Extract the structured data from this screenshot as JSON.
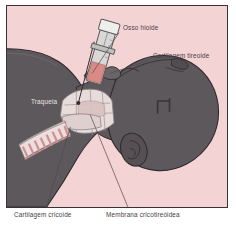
{
  "figure": {
    "kind": "medical-illustration",
    "language": "pt-BR",
    "background_color": "#f4d3d5",
    "frame_color": "#3a3236",
    "body_color": "#5d585c",
    "cartilage_color": "#e8dcdb",
    "trachea_ring_color": "#d8a3a5",
    "syringe_body_color": "#d8d8d6",
    "syringe_fluid_color": "#d98a86"
  },
  "labels": {
    "hyoid_bone": "Osso hioide",
    "thyroid_cartilage": "Cartilagem tireoide",
    "trachea": "Traqueia",
    "cricoid_cartilage": "Cartilagem cricoide",
    "cricothyroid_membrane": "Membrana cricotireóidea"
  },
  "label_positions": {
    "hyoid_bone": {
      "x": 116,
      "y": 22
    },
    "thyroid_cartilage": {
      "x": 146,
      "y": 50
    },
    "trachea": {
      "x": 23,
      "y": 95
    },
    "cricoid_cartilage": {
      "x": 14,
      "y": 16
    },
    "cricothyroid_membrane": {
      "x": 104,
      "y": 16
    }
  },
  "leader_lines": [
    {
      "name": "hyoid-leader",
      "x1": 113,
      "y1": 27,
      "x2": 83,
      "y2": 69
    },
    {
      "name": "thyroid-leader",
      "x1": 143,
      "y1": 55,
      "x2": 96,
      "y2": 70
    },
    {
      "name": "cricoid-leader",
      "x1": 36,
      "y1": 205,
      "x2": 62,
      "y2": 122
    },
    {
      "name": "membrane-leader",
      "x1": 120,
      "y1": 205,
      "x2": 83,
      "y2": 108
    }
  ],
  "icon_names": [
    "syringe-icon",
    "needle-icon",
    "trachea-rings-icon",
    "ear-icon",
    "hyoid-bone-icon",
    "thyroid-cartilage-icon",
    "cricoid-cartilage-icon"
  ]
}
